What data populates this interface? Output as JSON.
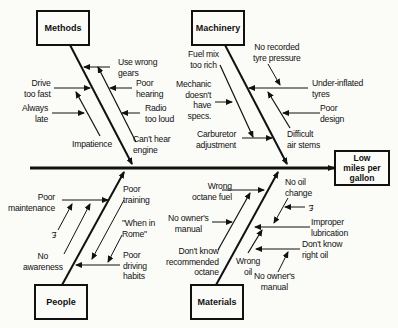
{
  "effect": {
    "label": "Low\nmiles per\ngallon"
  },
  "categories": {
    "methods": {
      "label": "Methods",
      "causes": [
        {
          "label": "Use wrong\ngears"
        },
        {
          "label": "Poor\nhearing"
        },
        {
          "label": "Radio\ntoo loud"
        },
        {
          "label": "Can't hear\nengine"
        },
        {
          "label": "Drive\ntoo fast"
        },
        {
          "label": "Always\nlate"
        },
        {
          "label": "Impatience"
        }
      ]
    },
    "machinery": {
      "label": "Machinery",
      "causes": [
        {
          "label": "Fuel mix\ntoo rich"
        },
        {
          "label": "No recorded\ntyre pressure"
        },
        {
          "label": "Under-inflated\ntyres"
        },
        {
          "label": "Mechanic\ndoesn't\nhave\nspecs."
        },
        {
          "label": "Poor\ndesign"
        },
        {
          "label": "Carburetor\nadjustment"
        },
        {
          "label": "Difficult\nair stems"
        }
      ]
    },
    "people": {
      "label": "People",
      "causes": [
        {
          "label": "Poor\nmaintenance"
        },
        {
          "label": "£"
        },
        {
          "label": "No\nawareness"
        },
        {
          "label": "Poor\ntraining"
        },
        {
          "label": "\"When in\nRome\""
        },
        {
          "label": "Poor\ndriving\nhabits"
        }
      ]
    },
    "materials": {
      "label": "Materials",
      "causes": [
        {
          "label": "Wrong\noctane fuel"
        },
        {
          "label": "No owner's\nmanual"
        },
        {
          "label": "Don't know\nrecommended\noctane"
        },
        {
          "label": "No oil\nchange"
        },
        {
          "label": "£"
        },
        {
          "label": "Improper\nlubrication"
        },
        {
          "label": "Don't know\nright oil"
        },
        {
          "label": "Wrong\noil"
        },
        {
          "label": "No owner's\nmanual"
        }
      ]
    }
  }
}
